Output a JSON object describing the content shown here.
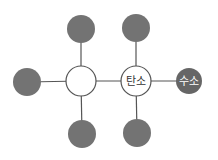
{
  "diagram": {
    "type": "molecule-structure",
    "atoms": [
      {
        "id": "c1",
        "x": 81,
        "y": 81,
        "r": 15,
        "style": "white",
        "label": ""
      },
      {
        "id": "c2",
        "x": 136,
        "y": 81,
        "r": 15,
        "style": "white",
        "label": "탄소"
      },
      {
        "id": "g1",
        "x": 81,
        "y": 29,
        "r": 14,
        "style": "gray",
        "label": ""
      },
      {
        "id": "g2",
        "x": 136,
        "y": 28,
        "r": 14,
        "style": "gray",
        "label": ""
      },
      {
        "id": "g3",
        "x": 27,
        "y": 82,
        "r": 14,
        "style": "gray",
        "label": ""
      },
      {
        "id": "g4",
        "x": 82,
        "y": 134,
        "r": 14,
        "style": "gray",
        "label": ""
      },
      {
        "id": "g5",
        "x": 137,
        "y": 133,
        "r": 14,
        "style": "gray",
        "label": ""
      },
      {
        "id": "h1",
        "x": 189,
        "y": 81,
        "r": 13,
        "style": "dark",
        "label": "수소"
      }
    ],
    "bonds": [
      [
        "c1",
        "c2"
      ],
      [
        "c1",
        "g1"
      ],
      [
        "c1",
        "g3"
      ],
      [
        "c1",
        "g4"
      ],
      [
        "c2",
        "g2"
      ],
      [
        "c2",
        "g5"
      ],
      [
        "c2",
        "h1"
      ]
    ],
    "labels": {
      "carbon": "탄소",
      "hydrogen": "수소"
    },
    "colors": {
      "bond": "#555555",
      "gray_atom": "#737373",
      "hydrogen_atom": "#666666",
      "white_atom": "#ffffff",
      "label_dark": "#333333",
      "label_light": "#ffffff"
    }
  }
}
